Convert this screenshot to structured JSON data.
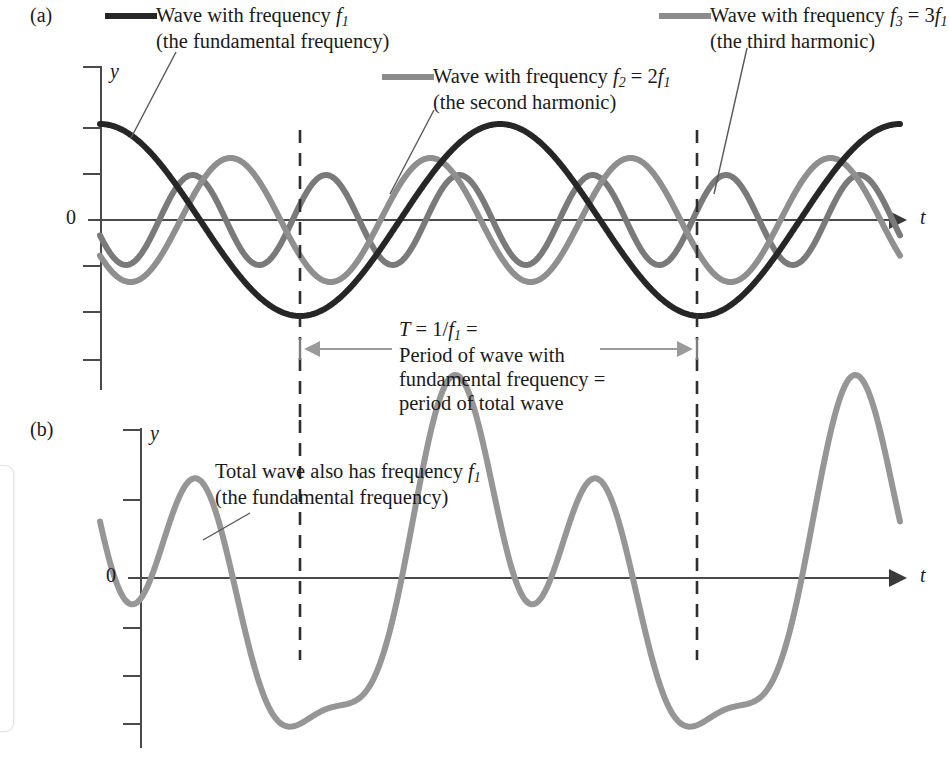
{
  "figure": {
    "panel_a_tag": "(a)",
    "panel_b_tag": "(b)",
    "axis_y_label": "y",
    "axis_t_label": "t",
    "zero_label": "0"
  },
  "legend": {
    "fundamental": {
      "line1_a": "Wave with frequency ",
      "line1_var": "f",
      "line1_sub": "1",
      "line2": "(the fundamental frequency)",
      "color": "#262626",
      "swatch": "legend-swatch-fundamental"
    },
    "second_harmonic": {
      "line1_a": "Wave with frequency ",
      "line1_var": "f",
      "line1_sub": "2",
      "line1_b": " = 2",
      "line1_var2": "f",
      "line1_sub2": "1",
      "line2": "(the second harmonic)",
      "color": "#8c8c8c",
      "swatch": "legend-swatch-second-harmonic"
    },
    "third_harmonic": {
      "line1_a": "Wave with frequency ",
      "line1_var": "f",
      "line1_sub": "3",
      "line1_b": " = 3",
      "line1_var2": "f",
      "line1_sub2": "1",
      "line2": "(the third harmonic)",
      "color": "#8c8c8c",
      "swatch": "legend-swatch-third-harmonic"
    }
  },
  "period_note": {
    "line1_pre": "T",
    "line1_mid": " = 1/",
    "line1_var": "f",
    "line1_sub": "1",
    "line1_post": " =",
    "line2": "Period of wave with",
    "line3": "fundamental frequency =",
    "line4": "period of total wave"
  },
  "total_note": {
    "line1_a": "Total wave also has frequency ",
    "line1_var": "f",
    "line1_sub": "1",
    "line2": "(the fundamental frequency)"
  },
  "chart_data": {
    "type": "line",
    "xlabel": "t",
    "ylabel": "y",
    "grid": false,
    "legend_position": "top",
    "panels": [
      {
        "id": "a",
        "label": "(a)",
        "description": "Three component waves plotted versus time",
        "x_range_px": [
          100,
          900
        ],
        "baseline_y_px": 220,
        "series": [
          {
            "name": "Wave with frequency f1 (the fundamental frequency)",
            "harmonic": 1,
            "amplitude": 96,
            "phase_deg": 90,
            "cycles_over_plot": 2.0,
            "color": "#262626",
            "stroke_width": 6
          },
          {
            "name": "Wave with frequency f2 = 2f1 (the second harmonic)",
            "harmonic": 2,
            "amplitude": 62,
            "phase_deg": 215,
            "cycles_over_plot": 4.0,
            "color": "#8f8f8f",
            "stroke_width": 6
          },
          {
            "name": "Wave with frequency f3 = 3f1 (the third harmonic)",
            "harmonic": 3,
            "amplitude": 45,
            "phase_deg": 200,
            "cycles_over_plot": 6.0,
            "color": "#7a7a7a",
            "stroke_width": 6
          }
        ],
        "annotations": [
          {
            "name": "period-span",
            "text": "T = 1/f1 = Period of wave with fundamental frequency = period of total wave",
            "x_start_px": 300,
            "x_end_px": 697
          }
        ],
        "y_ticks_px": [
          128,
          176,
          220,
          268,
          316,
          364
        ],
        "dashed_lines_px": [
          300,
          697
        ]
      },
      {
        "id": "b",
        "label": "(b)",
        "description": "Total wave: sum of the three components",
        "x_range_px": [
          100,
          900
        ],
        "baseline_y_px": 578,
        "series": [
          {
            "name": "Total wave (sum of f1, f2 and f3)",
            "amplitude": 203,
            "color": "#969696",
            "stroke_width": 6
          }
        ],
        "annotations": [
          {
            "name": "total-wave-note",
            "text": "Total wave also has frequency f1 (the fundamental frequency)"
          }
        ],
        "y_ticks_px": [
          455,
          500,
          578,
          628,
          676,
          724
        ],
        "dashed_lines_px": [
          300,
          697
        ]
      }
    ]
  },
  "colors": {
    "axis": "#4a4a4a",
    "dashed": "#2e2e2e",
    "arrow": "#9a9a9a",
    "text": "#1a1a1a"
  }
}
